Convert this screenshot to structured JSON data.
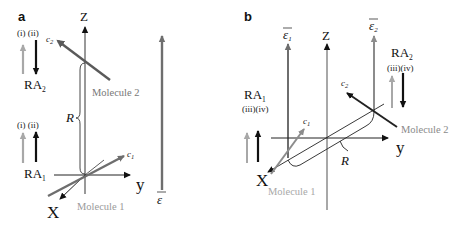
{
  "colors": {
    "black": "#111111",
    "axis_gray": "#6e6e6e",
    "light_gray": "#a8a8a8",
    "label_gray": "#8a8a8a",
    "molecule2_a": "#5a5a5a",
    "molecule1": "#8c8c8c"
  },
  "panel_a": {
    "label": "a",
    "axes": {
      "z": "Z",
      "y": "y",
      "x": "X"
    },
    "field": "ε",
    "molecule1": {
      "label": "Molecule 1",
      "dipole": "c",
      "dipole_sub": "1"
    },
    "molecule2": {
      "label": "Molecule 2",
      "dipole": "c",
      "dipole_sub": "2"
    },
    "separation": "R",
    "ra2": {
      "name": "RA",
      "sub": "2",
      "cases": "(i) (ii)",
      "arrows": [
        {
          "case": "(i)",
          "direction": "up",
          "color": "gray"
        },
        {
          "case": "(ii)",
          "direction": "down",
          "color": "black"
        }
      ]
    },
    "ra1": {
      "name": "RA",
      "sub": "1",
      "cases": "(i) (ii)",
      "arrows": [
        {
          "case": "(i)",
          "direction": "up",
          "color": "gray"
        },
        {
          "case": "(ii)",
          "direction": "up",
          "color": "black"
        }
      ]
    }
  },
  "panel_b": {
    "label": "b",
    "axes": {
      "z": "Z",
      "y": "y",
      "x": "X"
    },
    "field1": {
      "symbol": "ε",
      "sub": "1"
    },
    "field2": {
      "symbol": "ε",
      "sub": "2"
    },
    "molecule1": {
      "label": "Molecule 1",
      "dipole": "c",
      "dipole_sub": "1"
    },
    "molecule2": {
      "label": "Molecule 2",
      "dipole": "c",
      "dipole_sub": "2"
    },
    "separation": "R",
    "ra1": {
      "name": "RA",
      "sub": "1",
      "cases": "(iii)(iv)",
      "arrows": [
        {
          "case": "(iii)",
          "direction": "up",
          "color": "gray"
        },
        {
          "case": "(iv)",
          "direction": "up",
          "color": "black"
        }
      ]
    },
    "ra2": {
      "name": "RA",
      "sub": "2",
      "cases": "(iii)(iv)",
      "arrows": [
        {
          "case": "(iii)",
          "direction": "up",
          "color": "gray"
        },
        {
          "case": "(iv)",
          "direction": "down",
          "color": "black"
        }
      ]
    }
  }
}
